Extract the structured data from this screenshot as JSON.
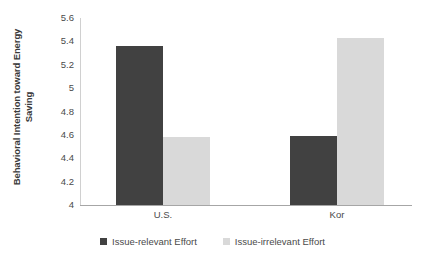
{
  "chart_data": {
    "type": "bar",
    "title": "",
    "xlabel": "",
    "ylabel": "Behavioral Intention toward Energy Saving",
    "ylabel_line1": "Behavioral Intention toward Energy",
    "ylabel_line2": "Saving",
    "categories": [
      "U.S.",
      "Kor"
    ],
    "series": [
      {
        "name": "Issue-relevant Effort",
        "values": [
          5.36,
          4.59
        ],
        "color": "#414141"
      },
      {
        "name": "Issue-irrelevant Effort",
        "values": [
          4.58,
          5.43
        ],
        "color": "#d9d9d9"
      }
    ],
    "ylim": [
      4,
      5.6
    ],
    "yticks": [
      "5.6",
      "5.4",
      "5.2",
      "5",
      "4.8",
      "4.6",
      "4.4",
      "4.2",
      "4"
    ],
    "ytick_values": [
      5.6,
      5.4,
      5.2,
      5.0,
      4.8,
      4.6,
      4.4,
      4.2,
      4.0
    ],
    "grid": false,
    "legend_position": "bottom"
  }
}
